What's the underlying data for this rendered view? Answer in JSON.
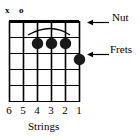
{
  "diagram": {
    "type": "guitar-chord-diagram",
    "title": "",
    "colors": {
      "ink": "#000000",
      "background": "#ffffff",
      "grid": "#000000",
      "dot": "#1a1a1a"
    },
    "grid": {
      "string_count": 6,
      "fret_count": 5,
      "left": 9,
      "right": 79,
      "top": 21,
      "bottom": 101,
      "string_spacing": 14,
      "fret_spacing": 16,
      "nut_thickness": 3,
      "line_thickness": 1.2
    },
    "open_markers": [
      {
        "name": "mute-marker",
        "symbol": "x",
        "string": 6,
        "x": 9,
        "y": 12
      },
      {
        "name": "open-marker",
        "symbol": "o",
        "string": 5,
        "x": 23,
        "y": 12
      }
    ],
    "finger_dots": [
      {
        "string": 4,
        "fret": 1,
        "cx": 37,
        "cy": 43,
        "r": 5.6
      },
      {
        "string": 3,
        "fret": 1,
        "cx": 51,
        "cy": 43,
        "r": 5.6
      },
      {
        "string": 2,
        "fret": 1,
        "cx": 65,
        "cy": 43,
        "r": 5.6
      },
      {
        "string": 1,
        "fret": 2,
        "cx": 79,
        "cy": 59,
        "r": 5.6
      }
    ],
    "arc": {
      "name": "slur-arc",
      "start_x": 28,
      "start_y": 35,
      "peak_x": 51,
      "peak_y": 25,
      "end_x": 70,
      "end_y": 35
    },
    "annotations": [
      {
        "name": "nut",
        "label": "Nut",
        "label_x": 116,
        "label_y": 17,
        "arrow_from_x": 110,
        "arrow_to_x": 88,
        "arrow_y": 22
      },
      {
        "name": "frets",
        "label": "Frets",
        "label_x": 114,
        "label_y": 49,
        "arrow_from_x": 110,
        "arrow_to_x": 88,
        "arrow_y": 54
      }
    ],
    "string_numbers": {
      "label": "Strings",
      "caption_x": 44,
      "caption_y": 126,
      "numbers": [
        {
          "value": "6",
          "x": 9
        },
        {
          "value": "5",
          "x": 23
        },
        {
          "value": "4",
          "x": 37
        },
        {
          "value": "3",
          "x": 51
        },
        {
          "value": "2",
          "x": 65
        },
        {
          "value": "1",
          "x": 79
        }
      ],
      "numbers_y": 110
    }
  }
}
